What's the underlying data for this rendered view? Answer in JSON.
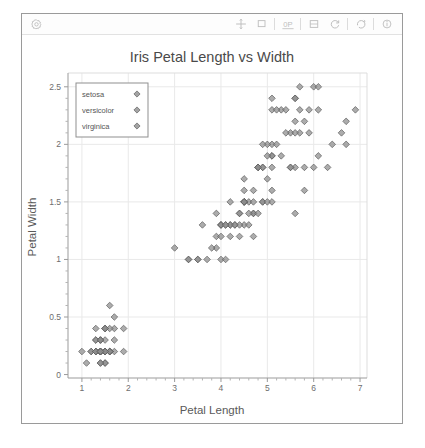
{
  "window": {
    "title": "Render View",
    "toolbar": {
      "left_icons": [
        {
          "name": "render-view-options-icon",
          "label": "View Options"
        }
      ],
      "right_icons": [
        {
          "name": "move-crosshair-icon",
          "label": "Pan"
        },
        {
          "name": "select-rectangle-icon",
          "label": "Select Region"
        },
        {
          "name": "zero-p-icon",
          "label": "Reset Camera Parallel"
        },
        {
          "name": "split-horizontal-icon",
          "label": "Split View"
        },
        {
          "name": "reset-camera-icon",
          "label": "Reset Camera"
        },
        {
          "name": "rotate-icon",
          "label": "Rotate"
        },
        {
          "name": "info-icon",
          "label": "Information"
        }
      ]
    }
  },
  "chart_data": {
    "type": "scatter",
    "title": "Iris Petal Length vs Width",
    "xlabel": "Petal Length",
    "ylabel": "Petal Width",
    "xlim": [
      0.7,
      7.15
    ],
    "ylim": [
      -0.03,
      2.62
    ],
    "xticks": [
      1,
      2,
      3,
      4,
      5,
      6,
      7
    ],
    "xticklabels": [
      "1",
      "2",
      "3",
      "4",
      "5",
      "6",
      "7"
    ],
    "yticks": [
      0,
      0.5,
      1,
      1.5,
      2,
      2.5
    ],
    "yticklabels": [
      "0",
      "0.5",
      "1",
      "1.5",
      "2",
      "2.5"
    ],
    "grid": true,
    "legend_position": "upper left",
    "marker": "diamond",
    "marker_color": "#8c8c8c",
    "marker_edge_color": "#5d5d5d",
    "series": [
      {
        "name": "setosa",
        "points": [
          [
            1.4,
            0.2
          ],
          [
            1.4,
            0.2
          ],
          [
            1.3,
            0.2
          ],
          [
            1.5,
            0.2
          ],
          [
            1.4,
            0.2
          ],
          [
            1.7,
            0.4
          ],
          [
            1.4,
            0.3
          ],
          [
            1.5,
            0.2
          ],
          [
            1.4,
            0.2
          ],
          [
            1.5,
            0.1
          ],
          [
            1.5,
            0.2
          ],
          [
            1.6,
            0.2
          ],
          [
            1.4,
            0.1
          ],
          [
            1.1,
            0.1
          ],
          [
            1.2,
            0.2
          ],
          [
            1.5,
            0.4
          ],
          [
            1.3,
            0.4
          ],
          [
            1.4,
            0.3
          ],
          [
            1.7,
            0.3
          ],
          [
            1.5,
            0.3
          ],
          [
            1.7,
            0.2
          ],
          [
            1.5,
            0.4
          ],
          [
            1.0,
            0.2
          ],
          [
            1.7,
            0.5
          ],
          [
            1.9,
            0.2
          ],
          [
            1.6,
            0.2
          ],
          [
            1.6,
            0.4
          ],
          [
            1.5,
            0.2
          ],
          [
            1.4,
            0.2
          ],
          [
            1.6,
            0.2
          ],
          [
            1.6,
            0.2
          ],
          [
            1.5,
            0.4
          ],
          [
            1.5,
            0.1
          ],
          [
            1.4,
            0.2
          ],
          [
            1.5,
            0.2
          ],
          [
            1.2,
            0.2
          ],
          [
            1.3,
            0.2
          ],
          [
            1.4,
            0.1
          ],
          [
            1.3,
            0.2
          ],
          [
            1.5,
            0.2
          ],
          [
            1.3,
            0.3
          ],
          [
            1.3,
            0.3
          ],
          [
            1.3,
            0.2
          ],
          [
            1.6,
            0.6
          ],
          [
            1.9,
            0.4
          ],
          [
            1.4,
            0.3
          ],
          [
            1.6,
            0.2
          ],
          [
            1.4,
            0.2
          ],
          [
            1.5,
            0.2
          ],
          [
            1.4,
            0.2
          ]
        ]
      },
      {
        "name": "versicolor",
        "points": [
          [
            4.7,
            1.4
          ],
          [
            4.5,
            1.5
          ],
          [
            4.9,
            1.5
          ],
          [
            4.0,
            1.3
          ],
          [
            4.6,
            1.5
          ],
          [
            4.5,
            1.3
          ],
          [
            4.7,
            1.6
          ],
          [
            3.3,
            1.0
          ],
          [
            4.6,
            1.3
          ],
          [
            3.9,
            1.4
          ],
          [
            3.5,
            1.0
          ],
          [
            4.2,
            1.5
          ],
          [
            4.0,
            1.0
          ],
          [
            4.7,
            1.4
          ],
          [
            3.6,
            1.3
          ],
          [
            4.4,
            1.4
          ],
          [
            4.5,
            1.5
          ],
          [
            4.1,
            1.0
          ],
          [
            4.5,
            1.5
          ],
          [
            3.9,
            1.1
          ],
          [
            4.8,
            1.8
          ],
          [
            4.0,
            1.3
          ],
          [
            4.9,
            1.5
          ],
          [
            4.7,
            1.2
          ],
          [
            4.3,
            1.3
          ],
          [
            4.4,
            1.4
          ],
          [
            4.8,
            1.4
          ],
          [
            5.0,
            1.7
          ],
          [
            4.5,
            1.5
          ],
          [
            3.5,
            1.0
          ],
          [
            3.8,
            1.1
          ],
          [
            3.7,
            1.0
          ],
          [
            3.9,
            1.2
          ],
          [
            5.1,
            1.6
          ],
          [
            4.5,
            1.5
          ],
          [
            4.5,
            1.6
          ],
          [
            4.7,
            1.5
          ],
          [
            4.4,
            1.3
          ],
          [
            4.1,
            1.3
          ],
          [
            4.0,
            1.3
          ],
          [
            4.4,
            1.2
          ],
          [
            4.6,
            1.4
          ],
          [
            4.0,
            1.2
          ],
          [
            3.3,
            1.0
          ],
          [
            4.2,
            1.3
          ],
          [
            4.2,
            1.2
          ],
          [
            4.2,
            1.3
          ],
          [
            4.3,
            1.3
          ],
          [
            3.0,
            1.1
          ],
          [
            4.1,
            1.3
          ]
        ]
      },
      {
        "name": "virginica",
        "points": [
          [
            6.0,
            2.5
          ],
          [
            5.1,
            1.9
          ],
          [
            5.9,
            2.1
          ],
          [
            5.6,
            1.8
          ],
          [
            5.8,
            2.2
          ],
          [
            6.6,
            2.1
          ],
          [
            4.5,
            1.7
          ],
          [
            6.3,
            1.8
          ],
          [
            5.8,
            1.8
          ],
          [
            6.1,
            2.5
          ],
          [
            5.1,
            2.0
          ],
          [
            5.3,
            1.9
          ],
          [
            5.5,
            2.1
          ],
          [
            5.0,
            2.0
          ],
          [
            5.1,
            2.4
          ],
          [
            5.3,
            2.3
          ],
          [
            5.5,
            1.8
          ],
          [
            6.7,
            2.2
          ],
          [
            6.9,
            2.3
          ],
          [
            5.0,
            1.5
          ],
          [
            5.7,
            2.3
          ],
          [
            4.9,
            2.0
          ],
          [
            6.7,
            2.0
          ],
          [
            4.9,
            1.8
          ],
          [
            5.7,
            2.1
          ],
          [
            6.0,
            1.8
          ],
          [
            4.8,
            1.8
          ],
          [
            4.9,
            1.8
          ],
          [
            5.6,
            2.1
          ],
          [
            5.8,
            1.6
          ],
          [
            6.1,
            1.9
          ],
          [
            6.4,
            2.0
          ],
          [
            5.6,
            2.2
          ],
          [
            5.1,
            1.5
          ],
          [
            5.6,
            1.4
          ],
          [
            6.1,
            2.3
          ],
          [
            5.6,
            2.4
          ],
          [
            5.5,
            1.8
          ],
          [
            4.8,
            1.8
          ],
          [
            5.4,
            2.1
          ],
          [
            5.6,
            2.4
          ],
          [
            5.1,
            2.3
          ],
          [
            5.1,
            1.9
          ],
          [
            5.9,
            2.3
          ],
          [
            5.7,
            2.5
          ],
          [
            5.2,
            2.3
          ],
          [
            5.0,
            1.9
          ],
          [
            5.2,
            2.0
          ],
          [
            5.4,
            2.3
          ],
          [
            5.1,
            1.8
          ]
        ]
      }
    ]
  }
}
